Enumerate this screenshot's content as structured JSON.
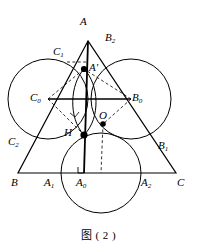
{
  "figure": {
    "caption": "图 ( 2 )",
    "stroke_color": "#000000",
    "background_color": "#ffffff",
    "width": 197,
    "height": 249,
    "labels": {
      "A": "A",
      "B": "B",
      "C": "C",
      "A_prime": "A",
      "A_prime_mark": "'",
      "A0": "A",
      "A0_sub": "0",
      "A1": "A",
      "A1_sub": "1",
      "A2": "A",
      "A2_sub": "2",
      "B0": "B",
      "B0_sub": "0",
      "B1": "B",
      "B1_sub": "1",
      "B2": "B",
      "B2_sub": "2",
      "C0": "C",
      "C0_sub": "0",
      "C1": "C",
      "C1_sub": "1",
      "C2": "C",
      "C2_sub": "2",
      "H": "H",
      "O": "O"
    },
    "points": {
      "A": {
        "x": 88,
        "y": 41
      },
      "B": {
        "x": 18,
        "y": 173
      },
      "C": {
        "x": 176,
        "y": 173
      },
      "A_prime": {
        "x": 84,
        "y": 69
      },
      "H": {
        "x": 84,
        "y": 135
      },
      "O": {
        "x": 103,
        "y": 124
      },
      "A0": {
        "x": 84,
        "y": 173
      },
      "A1": {
        "x": 58,
        "y": 173
      },
      "A2": {
        "x": 143,
        "y": 173
      },
      "B0": {
        "x": 131,
        "y": 99
      },
      "B1": {
        "x": 157,
        "y": 143
      },
      "B2": {
        "x": 108,
        "y": 53
      },
      "C0": {
        "x": 48,
        "y": 99
      },
      "C1": {
        "x": 67,
        "y": 56
      },
      "C2": {
        "x": 33,
        "y": 141
      }
    },
    "circles": [
      {
        "name": "circle-C0",
        "cx": 48,
        "cy": 99,
        "r": 40
      },
      {
        "name": "circle-B0",
        "cx": 131,
        "cy": 99,
        "r": 40
      },
      {
        "name": "circle-A0",
        "cx": 101,
        "cy": 173,
        "r": 40
      },
      {
        "name": "circle-inner-left",
        "cx": 64,
        "cy": 101,
        "r": 36
      },
      {
        "name": "circle-inner-right",
        "cx": 104,
        "cy": 101,
        "r": 36
      }
    ],
    "label_positions": {
      "A": {
        "left": 80,
        "top": 16
      },
      "B": {
        "left": 11,
        "top": 177
      },
      "C": {
        "left": 177,
        "top": 177
      },
      "A_prime": {
        "left": 89,
        "top": 62
      },
      "H": {
        "left": 64,
        "top": 127
      },
      "O": {
        "left": 99,
        "top": 110
      },
      "A0": {
        "left": 76,
        "top": 177
      },
      "A1": {
        "left": 44,
        "top": 177
      },
      "A2": {
        "left": 141,
        "top": 177
      },
      "B0": {
        "left": 132,
        "top": 92
      },
      "B1": {
        "left": 158,
        "top": 140
      },
      "B2": {
        "left": 105,
        "top": 32
      },
      "C0": {
        "left": 30,
        "top": 92
      },
      "C1": {
        "left": 53,
        "top": 46
      },
      "C2": {
        "left": 8,
        "top": 136
      }
    }
  }
}
